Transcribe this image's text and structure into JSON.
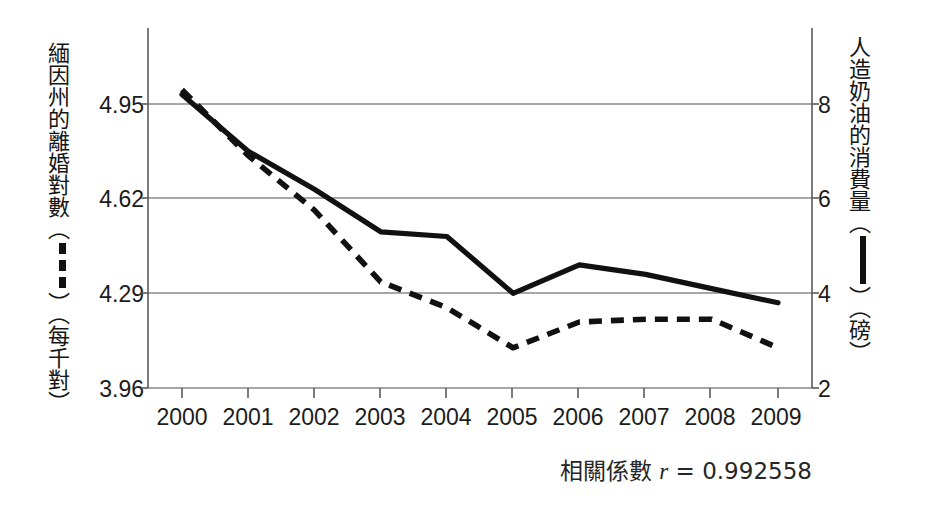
{
  "chart_data": {
    "type": "line",
    "title": "",
    "subtitle": "",
    "xlabel": "",
    "ylabel": "緬因州的離婚對數（▪▪▪）（每千對）",
    "y2label": "人造奶油的消費量（▮）（磅）",
    "categories": [
      "2000",
      "2001",
      "2002",
      "2003",
      "2004",
      "2005",
      "2006",
      "2007",
      "2008",
      "2009"
    ],
    "x": [
      2000,
      2001,
      2002,
      2003,
      2004,
      2005,
      2006,
      2007,
      2008,
      2009
    ],
    "grid": true,
    "legend_position": "axis-titles",
    "ylim": [
      3.96,
      5.28
    ],
    "y2lim": [
      2,
      10
    ],
    "yticks": [
      "4.95",
      "4.62",
      "4.29",
      "3.96"
    ],
    "ytick_values": [
      4.95,
      4.62,
      4.29,
      3.96
    ],
    "y2ticks": [
      "8",
      "6",
      "4",
      "2"
    ],
    "y2tick_values": [
      8,
      6,
      4,
      2
    ],
    "series": [
      {
        "name": "緬因州的離婚對數（每千對）",
        "axis": "left",
        "style": "dashed",
        "color": "#111111",
        "values": [
          5.0,
          4.77,
          4.58,
          4.33,
          4.24,
          4.1,
          4.19,
          4.2,
          4.2,
          4.1
        ]
      },
      {
        "name": "人造奶油的消費量（磅）",
        "axis": "right",
        "style": "solid",
        "color": "#111111",
        "values": [
          8.2,
          7.0,
          6.2,
          5.3,
          5.2,
          4.0,
          4.6,
          4.4,
          4.1,
          3.8
        ]
      }
    ],
    "annotations": [
      {
        "name": "correlation",
        "text": "相關係數 r = 0.992558",
        "r": 0.992558
      }
    ]
  },
  "axis_titles": {
    "left": {
      "before_glyph": "緬因州的離婚對數（",
      "glyph": "dashed-line-glyph",
      "after_glyph": "）（每千對）"
    },
    "right": {
      "before_glyph": "人造奶油的消費量（",
      "glyph": "solid-line-glyph",
      "after_glyph": "）（磅）"
    }
  },
  "caption": {
    "label": "相關係數",
    "variable": "r",
    "equals": "=",
    "value": "0.992558"
  },
  "colors": {
    "ink": "#111111",
    "grid": "#8a8a8a",
    "axis": "#5a5a5a",
    "background": "#ffffff"
  }
}
